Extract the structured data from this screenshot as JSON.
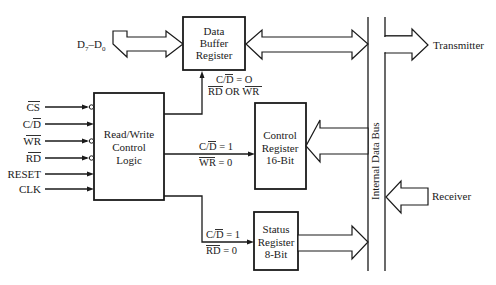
{
  "diagram": {
    "type": "block-diagram",
    "blocks": {
      "data_buffer": {
        "lines": [
          "Data",
          "Buffer",
          "Register"
        ]
      },
      "control_logic": {
        "lines": [
          "Read/Write",
          "Control",
          "Logic"
        ]
      },
      "control_register": {
        "lines": [
          "Control",
          "Register",
          "16-Bit"
        ]
      },
      "status_register": {
        "lines": [
          "Status",
          "Register",
          "8-Bit"
        ]
      }
    },
    "external": {
      "data_bus_label_main": "D",
      "data_bus_sub_hi": "7",
      "data_bus_dash": "–D",
      "data_bus_sub_lo": "0",
      "transmitter": "Transmitter",
      "receiver": "Receiver",
      "internal_bus": "Internal Data Bus"
    },
    "inputs": [
      {
        "label": "CS",
        "overbar": "CS",
        "plain": "",
        "inverted": true
      },
      {
        "label": "C/D",
        "overbar": "D",
        "plain": "C/",
        "inverted": false
      },
      {
        "label": "WR",
        "overbar": "WR",
        "plain": "",
        "inverted": true
      },
      {
        "label": "RD",
        "overbar": "RD",
        "plain": "",
        "inverted": true
      },
      {
        "label": "RESET",
        "overbar": "",
        "plain": "RESET",
        "inverted": false
      },
      {
        "label": "CLK",
        "overbar": "",
        "plain": "CLK",
        "inverted": false
      }
    ],
    "conditions": {
      "data_buffer": {
        "line1_prefix": "C/",
        "line1_bar": "D",
        "line1_suffix": " = O",
        "line2_bar1": "RD",
        "line2_mid": " OR ",
        "line2_bar2": "WR"
      },
      "control_register": {
        "line1_prefix": "C/",
        "line1_bar": "D",
        "line1_suffix": " = 1",
        "line2_bar": "WR",
        "line2_suffix": " = 0"
      },
      "status_register": {
        "line1_prefix": "C/",
        "line1_bar": "D",
        "line1_suffix": " = 1",
        "line2_bar": "RD",
        "line2_suffix": " = 0"
      }
    }
  }
}
